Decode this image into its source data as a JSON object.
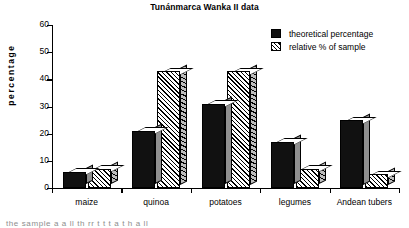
{
  "chart_data": {
    "type": "bar",
    "title": "Tunánmarca Wanka II data",
    "xlabel": "",
    "ylabel": "percentage",
    "categories": [
      "maize",
      "quinoa",
      "potatoes",
      "legumes",
      "Andean tubers"
    ],
    "series": [
      {
        "name": "theoretical percentage",
        "pattern": "solid",
        "values": [
          6,
          21,
          31,
          17,
          25
        ]
      },
      {
        "name": "relative % of sample",
        "pattern": "diagonal-hatch",
        "values": [
          7,
          43,
          43,
          7,
          5
        ]
      }
    ],
    "ylim": [
      0,
      60
    ],
    "yticks": [
      0,
      10,
      20,
      30,
      40,
      50,
      60
    ],
    "ytick_labels": [
      "0",
      "10",
      "20",
      "30",
      "40",
      "50",
      "60"
    ],
    "grid": false,
    "legend_position": "top-right",
    "style": "3d-bars-monochrome"
  },
  "legend": {
    "entries": [
      {
        "label": "theoretical percentage",
        "swatch": "solid-black"
      },
      {
        "label": "relative % of sample",
        "swatch": "diagonal-hatch"
      }
    ]
  },
  "caption": {
    "cut_off_line": "the sample   a     a   ll   th   rr  t     t    t   a   t    h    a  ll"
  }
}
